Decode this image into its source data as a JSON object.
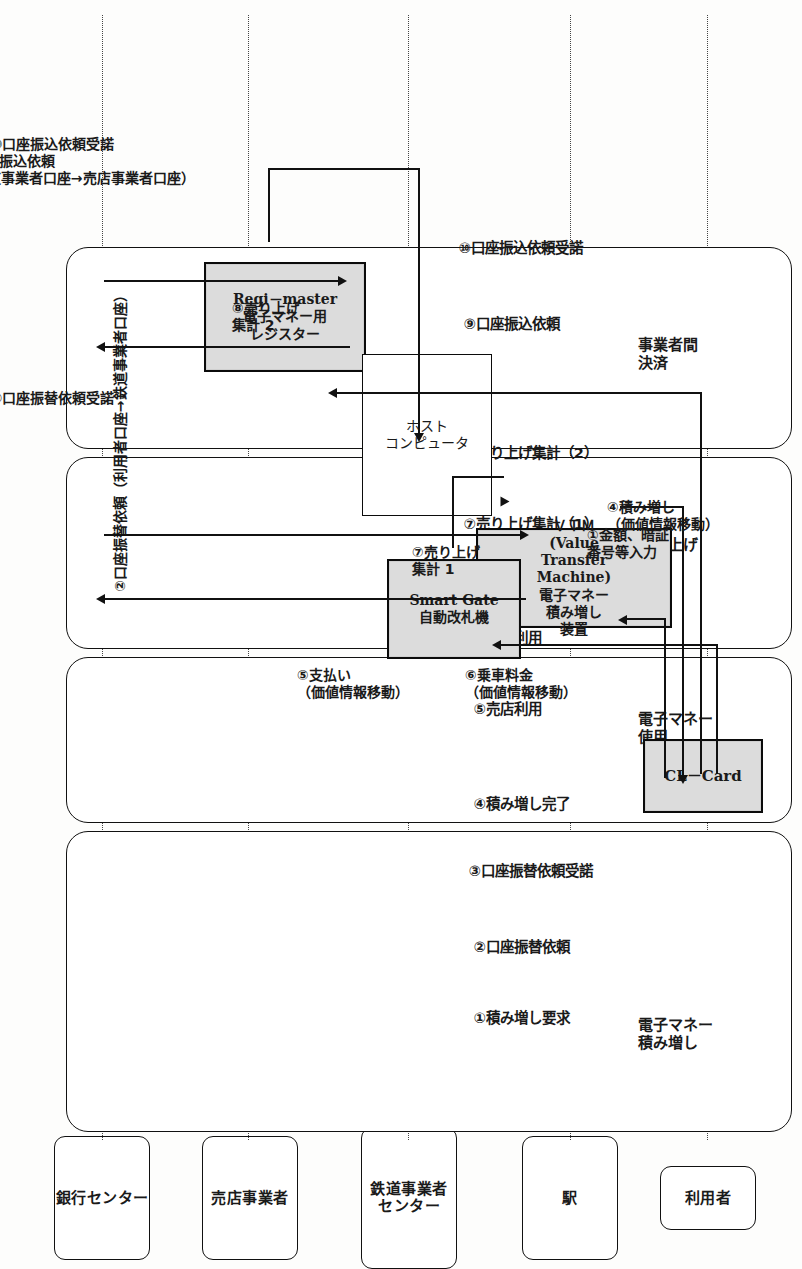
{
  "figure": {
    "orientation": "rotated-90"
  },
  "actors": [
    {
      "id": "user",
      "label": "利用者"
    },
    {
      "id": "station",
      "label": "駅"
    },
    {
      "id": "railcenter",
      "label": "鉄道事業者\nセンター"
    },
    {
      "id": "shop",
      "label": "売店事業者"
    },
    {
      "id": "bank",
      "label": "銀行センター"
    }
  ],
  "phases": [
    {
      "id": "charge",
      "label": "電子マネー\n積み増し",
      "steps": [
        "①積み増し要求",
        "②口座振替依頼",
        "③口座振替依頼受諾",
        "④積み増し完了"
      ]
    },
    {
      "id": "use",
      "label": "電子マネー\n使用",
      "steps": [
        "⑤売店利用",
        "⑥鉄道利用"
      ]
    },
    {
      "id": "sales",
      "label": "売り上げ\n集計",
      "steps": [
        "⑦売り上げ集計（1）",
        "⑧売り上げ集計（2）"
      ]
    },
    {
      "id": "settlement",
      "label": "事業者間\n決済",
      "steps": [
        "⑨口座振込依頼",
        "⑩口座振込依頼受諾"
      ]
    }
  ],
  "nodes": [
    {
      "id": "clcard",
      "label": "CL－Card"
    },
    {
      "id": "vtm",
      "label": "ＶＴＭ\n(Value\nTransfer\nMachine)\n電子マネー\n積み増し\n装置"
    },
    {
      "id": "smartgate",
      "label": "Smart Gate\n自動改札機"
    },
    {
      "id": "regimaster",
      "label": "Regi－master\n電子マネー用\nレジスター"
    },
    {
      "id": "host",
      "label": "ホスト\nコンピュータ"
    }
  ],
  "flows": [
    {
      "id": "f1",
      "label": "①金額、暗証\n番号等入力"
    },
    {
      "id": "f2",
      "label": "②口座振替依頼（利用者口座→鉄道事業者口座）"
    },
    {
      "id": "f3",
      "label": "③口座振替依頼受諾"
    },
    {
      "id": "f4",
      "label": "④積み増し\n（価値情報移動）"
    },
    {
      "id": "f5",
      "label": "⑤支払い\n（価値情報移動）"
    },
    {
      "id": "f6",
      "label": "⑥乗車料金\n（価値情報移動）"
    },
    {
      "id": "f7",
      "label": "⑦売り上げ\n集計 1"
    },
    {
      "id": "f8",
      "label": "⑧売り上げ\n集計 2"
    },
    {
      "id": "f9",
      "label": "⑨口座振込依頼\n（鉄道事業者口座→売店事業者口座）"
    },
    {
      "id": "f10",
      "label": "⑩口座振込依頼受諾"
    }
  ],
  "colors": {
    "ink": "#111111",
    "device_fill": "#dcdcdc",
    "paper": "#fdfdfc"
  }
}
